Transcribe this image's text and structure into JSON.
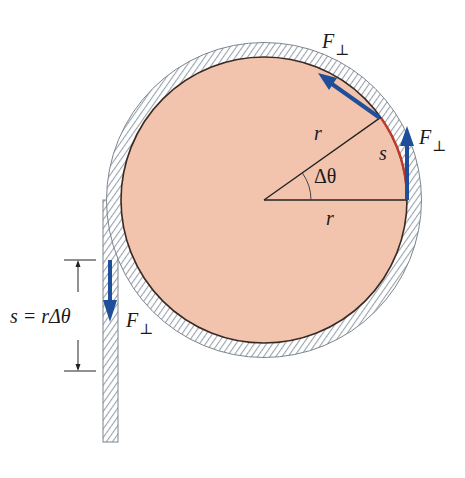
{
  "figure": {
    "colors": {
      "disk_fill": "#f2c3ad",
      "disk_outline": "#3a2a24",
      "rope_hatch": "#9aa3ad",
      "rope_fill": "#ffffff",
      "arc_s": "#c0392b",
      "force_arrow": "#1f4e9a",
      "lines": "#222222"
    },
    "labels": {
      "radius_upper": "r",
      "radius_lower": "r",
      "angle": "Δθ",
      "arc": "s",
      "force_top": "F",
      "force_top_sub": "⊥",
      "force_right": "F",
      "force_right_sub": "⊥",
      "force_rope": "F",
      "force_rope_sub": "⊥",
      "dimension_lhs": "s = ",
      "dimension_rhs": "rΔθ"
    }
  }
}
